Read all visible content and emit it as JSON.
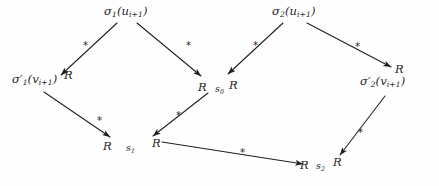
{
  "figure": {
    "type": "directed-graph-diagram",
    "background_color": "#fefefe",
    "ink_color": "#1f1f1f"
  },
  "nodes": [
    {
      "id": "sigma1-u",
      "text": "σ₁(uᵢ₊₁)",
      "sigma": "σ",
      "sigma_sub": "1",
      "arg": "u",
      "arg_sub": "i+1",
      "x": 104,
      "y": 6
    },
    {
      "id": "sigma2-u",
      "text": "σ₂(uᵢ₊₁)",
      "sigma": "σ",
      "sigma_sub": "2",
      "arg": "u",
      "arg_sub": "i+1",
      "x": 272,
      "y": 6
    },
    {
      "id": "sigma1-prime-v",
      "text": "σ′₁(vᵢ₊₁)",
      "sigma": "σ",
      "sigma_sub": "1",
      "arg": "v",
      "arg_sub": "i+1",
      "x": 12,
      "y": 74
    },
    {
      "id": "sigma2-prime-v",
      "text": "σ′₂(vᵢ₊₁)",
      "sigma": "σ",
      "sigma_sub": "2",
      "arg": "v",
      "arg_sub": "i+1",
      "x": 360,
      "y": 76
    },
    {
      "id": "state-s0",
      "text": "s₀",
      "base": "s",
      "sub": "0",
      "x": 215,
      "y": 84
    },
    {
      "id": "state-s1",
      "text": "s₁",
      "base": "s",
      "sub": "1",
      "x": 126,
      "y": 143
    },
    {
      "id": "state-s2",
      "text": "s₂",
      "base": "s",
      "sub": "2",
      "x": 316,
      "y": 161
    }
  ],
  "relation_labels": [
    {
      "id": "rel-left-top",
      "text": "R",
      "x": 64,
      "y": 70
    },
    {
      "id": "rel-mid-left",
      "text": "R",
      "x": 198,
      "y": 82
    },
    {
      "id": "rel-mid-right",
      "text": "R",
      "x": 229,
      "y": 80
    },
    {
      "id": "rel-right-top",
      "text": "R",
      "x": 395,
      "y": 64
    },
    {
      "id": "rel-s1-left",
      "text": "R",
      "x": 103,
      "y": 141
    },
    {
      "id": "rel-s1-right",
      "text": "R",
      "x": 152,
      "y": 138
    },
    {
      "id": "rel-s2-left",
      "text": "R",
      "x": 300,
      "y": 160
    },
    {
      "id": "rel-s2-right",
      "text": "R",
      "x": 333,
      "y": 157
    }
  ],
  "edges": [
    {
      "id": "edge-sigma1u-to-sigma1v",
      "from": "sigma1-u",
      "to": "sigma1-prime-v",
      "label": "*",
      "x1": 117,
      "y1": 23,
      "x2": 61,
      "y2": 75,
      "star_x": 83,
      "star_y": 41
    },
    {
      "id": "edge-sigma1u-to-s0",
      "from": "sigma1-u",
      "to": "state-s0",
      "label": "*",
      "x1": 137,
      "y1": 23,
      "x2": 201,
      "y2": 76,
      "star_x": 186,
      "star_y": 41
    },
    {
      "id": "edge-sigma2u-to-s0",
      "from": "sigma2-u",
      "to": "state-s0",
      "label": "*",
      "x1": 283,
      "y1": 23,
      "x2": 228,
      "y2": 74,
      "star_x": 253,
      "star_y": 41
    },
    {
      "id": "edge-sigma2u-to-sigma2v",
      "from": "sigma2-u",
      "to": "sigma2-prime-v",
      "label": "*",
      "x1": 307,
      "y1": 23,
      "x2": 391,
      "y2": 67,
      "star_x": 355,
      "star_y": 42
    },
    {
      "id": "edge-sigma1v-to-s1",
      "from": "sigma1-prime-v",
      "to": "state-s1",
      "label": "*",
      "x1": 44,
      "y1": 92,
      "x2": 110,
      "y2": 137,
      "star_x": 97,
      "star_y": 116
    },
    {
      "id": "edge-s0-to-s1",
      "from": "state-s0",
      "to": "state-s1",
      "label": "*",
      "x1": 208,
      "y1": 93,
      "x2": 153,
      "y2": 136,
      "star_x": 176,
      "star_y": 111
    },
    {
      "id": "edge-s1-to-s2",
      "from": "state-s1",
      "to": "state-s2",
      "label": "*",
      "x1": 162,
      "y1": 142,
      "x2": 303,
      "y2": 164,
      "star_x": 240,
      "star_y": 148
    },
    {
      "id": "edge-sigma2v-to-s2",
      "from": "sigma2-prime-v",
      "to": "state-s2",
      "label": "*",
      "x1": 385,
      "y1": 96,
      "x2": 340,
      "y2": 155,
      "star_x": 358,
      "star_y": 128
    }
  ]
}
